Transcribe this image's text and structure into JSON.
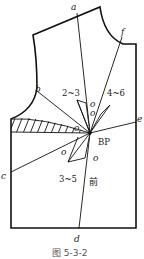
{
  "diagram": {
    "type": "garment-pattern",
    "caption": "图 5-3-2",
    "front_label": "前",
    "bust_point_label": "BP",
    "point_labels": {
      "a": "a",
      "b": "b",
      "c": "c",
      "d": "d",
      "e": "e",
      "f": "f"
    },
    "dart_labels": {
      "upper_left": "2~3",
      "upper_right": "4~6",
      "lower_left": "3~5"
    },
    "angle_marks": [
      "o",
      "o",
      "o",
      "o",
      "o"
    ],
    "colors": {
      "line": "#111111",
      "background": "#ffffff"
    }
  }
}
